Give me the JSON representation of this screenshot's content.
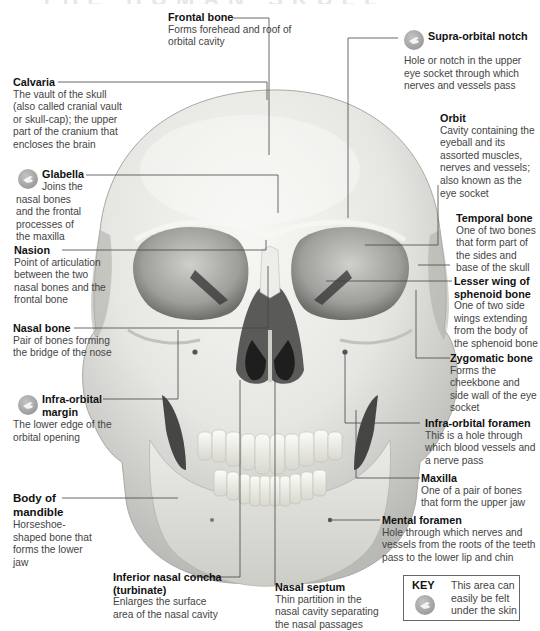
{
  "diagram": {
    "colors": {
      "bone_light": "#f2f2ee",
      "bone_mid": "#d9d9d4",
      "bone_shadow": "#9a9a96",
      "cavity_dark": "#3a3a3a",
      "leader_line": "#444444",
      "label_title": "#111111",
      "label_text": "#444444"
    },
    "labels": [
      {
        "id": "frontal-bone",
        "title": "Frontal bone",
        "text": "Forms forehead and roof of orbital cavity",
        "palpable": false
      },
      {
        "id": "supra-orbital-notch",
        "title": "Supra-orbital notch",
        "text": "Hole or notch in the upper eye socket through which nerves and vessels pass",
        "palpable": true
      },
      {
        "id": "calvaria",
        "title": "Calvaria",
        "text": "The vault of the skull (also called cranial vault or skull-cap); the upper part of the cranium that encloses the brain",
        "palpable": false
      },
      {
        "id": "orbit",
        "title": "Orbit",
        "text": "Cavity containing the eyeball and its assorted muscles, nerves and vessels; also known as the eye socket",
        "palpable": false
      },
      {
        "id": "glabella",
        "title": "Glabella",
        "text": "Joins the nasal bones and the frontal processes of the maxilla",
        "palpable": true
      },
      {
        "id": "temporal-bone",
        "title": "Temporal bone",
        "text": "One of two bones that form part of the sides and base of the skull",
        "palpable": false
      },
      {
        "id": "nasion",
        "title": "Nasion",
        "text": "Point of articulation between the two nasal bones and the frontal bone",
        "palpable": false
      },
      {
        "id": "lesser-wing-sphenoid",
        "title": "Lesser wing of sphenoid bone",
        "text": "One of two side wings extending from the body of the sphenoid bone",
        "palpable": false
      },
      {
        "id": "nasal-bone",
        "title": "Nasal bone",
        "text": "Pair of bones forming the bridge of the nose",
        "palpable": false
      },
      {
        "id": "zygomatic-bone",
        "title": "Zygomatic bone",
        "text": "Forms the cheekbone and side wall of the eye socket",
        "palpable": false
      },
      {
        "id": "infra-orbital-margin",
        "title": "Infra-orbital margin",
        "text": "The lower edge of the orbital opening",
        "palpable": true
      },
      {
        "id": "infra-orbital-foramen",
        "title": "Infra-orbital foramen",
        "text": "This is a hole through which blood vessels and a nerve pass",
        "palpable": false
      },
      {
        "id": "maxilla",
        "title": "Maxilla",
        "text": "One of a pair of bones that form the upper jaw",
        "palpable": false
      },
      {
        "id": "body-of-mandible",
        "title": "Body of mandible",
        "text": "Horseshoe-shaped bone that forms the lower jaw",
        "palpable": false
      },
      {
        "id": "mental-foramen",
        "title": "Mental foramen",
        "text": "Hole through which nerves and vessels from the roots of the teeth pass to the lower lip and chin",
        "palpable": false
      },
      {
        "id": "inferior-nasal-concha",
        "title": "Inferior nasal concha (turbinate)",
        "text": "Enlarges the surface area of the nasal cavity",
        "palpable": false
      },
      {
        "id": "nasal-septum",
        "title": "Nasal septum",
        "text": "Thin partition in the nasal cavity separating the nasal passages",
        "palpable": false
      }
    ],
    "key": {
      "title": "KEY",
      "icon": "hand-pointing-icon",
      "text": "This area can easily be felt under the skin"
    }
  }
}
